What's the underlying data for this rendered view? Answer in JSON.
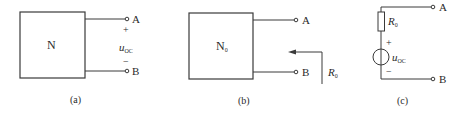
{
  "figures": [
    {
      "id": "a",
      "caption": "(a)",
      "network_label": "N",
      "terminals": [
        "A",
        "B"
      ],
      "voltage": {
        "symbol": "u",
        "subscript": "OC",
        "plus": "+",
        "minus": "−"
      }
    },
    {
      "id": "b",
      "caption": "(b)",
      "network_label": "N",
      "network_subscript": "0",
      "terminals": [
        "A",
        "B"
      ],
      "resistance": {
        "symbol": "R",
        "subscript": "0"
      }
    },
    {
      "id": "c",
      "caption": "(c)",
      "terminals": [
        "A",
        "B"
      ],
      "resistor": {
        "symbol": "R",
        "subscript": "0"
      },
      "source": {
        "symbol": "u",
        "subscript": "OC",
        "plus": "+",
        "minus": "−"
      }
    }
  ],
  "colors": {
    "line": "#3a3a3a",
    "background": "#ffffff"
  }
}
